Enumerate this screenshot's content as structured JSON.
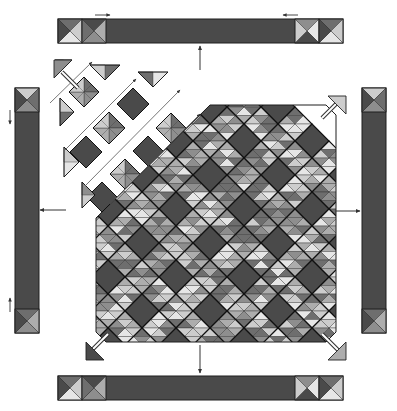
{
  "diagram": {
    "colors": {
      "background": "#ffffff",
      "dark": "#4a4a4a",
      "medium_dark": "#6e6e6e",
      "medium": "#8e8e8e",
      "medium_light": "#adadad",
      "light": "#cdcdcd",
      "very_light": "#e6e6e6",
      "outline": "#1e1e1e",
      "arrow": "#333333"
    },
    "borders": {
      "top": {
        "x": 58,
        "y": 19,
        "w": 285,
        "h": 24,
        "cornerstones": 2,
        "position": "both-ends"
      },
      "bottom": {
        "x": 58,
        "y": 376,
        "w": 285,
        "h": 24,
        "cornerstones": 2,
        "position": "both-ends"
      },
      "left": {
        "x": 15,
        "y": 88,
        "w": 24,
        "h": 245,
        "cornerstones": 1,
        "position": "both-ends"
      },
      "right": {
        "x": 362,
        "y": 88,
        "w": 24,
        "h": 245,
        "cornerstones": 1,
        "position": "both-ends"
      }
    },
    "quilt_center": {
      "x": 96,
      "y": 105,
      "w": 240,
      "h": 237,
      "block_size": 34,
      "layout": "on-point"
    },
    "detached_rows": {
      "count": 3,
      "location": "top-left-corner"
    },
    "arrows": [
      {
        "name": "top-border-arrow",
        "direction": "up"
      },
      {
        "name": "bottom-border-arrow",
        "direction": "down"
      },
      {
        "name": "left-border-arrow",
        "direction": "left"
      },
      {
        "name": "right-border-arrow",
        "direction": "right"
      },
      {
        "name": "corner-top-left-arrow",
        "direction": "up-left"
      },
      {
        "name": "corner-top-right-arrow",
        "direction": "up-right"
      },
      {
        "name": "corner-bottom-left-arrow",
        "direction": "down-left"
      },
      {
        "name": "corner-bottom-right-arrow",
        "direction": "down-right"
      }
    ]
  }
}
